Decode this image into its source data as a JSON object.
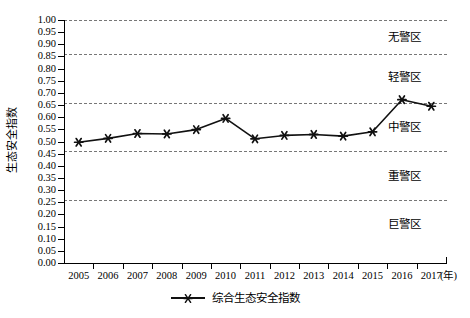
{
  "chart_data": {
    "type": "line",
    "title": "",
    "xlabel": "(年)",
    "ylabel": "生态安全指数",
    "categories": [
      "2005",
      "2006",
      "2007",
      "2008",
      "2009",
      "2010",
      "2011",
      "2012",
      "2013",
      "2014",
      "2015",
      "2016",
      "2017"
    ],
    "series": [
      {
        "name": "综合生态安全指数",
        "values": [
          0.497,
          0.513,
          0.533,
          0.531,
          0.549,
          0.595,
          0.511,
          0.525,
          0.529,
          0.522,
          0.54,
          0.672,
          0.645
        ],
        "marker": "asterisk-star",
        "color": "#111111"
      }
    ],
    "ylim": [
      0.0,
      1.0
    ],
    "ytick_labels": [
      "1.00",
      "0.95",
      "0.90",
      "0.85",
      "0.80",
      "0.75",
      "0.70",
      "0.65",
      "0.60",
      "0.55",
      "0.50",
      "0.45",
      "0.40",
      "0.35",
      "0.30",
      "0.25",
      "0.20",
      "0.15",
      "0.10",
      "0.05",
      "0.00"
    ],
    "ytick_values": [
      1.0,
      0.95,
      0.9,
      0.85,
      0.8,
      0.75,
      0.7,
      0.65,
      0.6,
      0.55,
      0.5,
      0.45,
      0.4,
      0.35,
      0.3,
      0.25,
      0.2,
      0.15,
      0.1,
      0.05,
      0.0
    ],
    "grid": true,
    "gridline_style": "dashed",
    "threshold_lines": [
      1.0,
      0.86,
      0.66,
      0.46,
      0.26
    ],
    "zones": [
      {
        "label": "无警区",
        "center": 0.93
      },
      {
        "label": "轻警区",
        "center": 0.765
      },
      {
        "label": "中警区",
        "center": 0.56
      },
      {
        "label": "重警区",
        "center": 0.36
      },
      {
        "label": "巨警区",
        "center": 0.16
      }
    ],
    "legend": {
      "position": "bottom-center",
      "entries": [
        "综合生态安全指数"
      ]
    }
  },
  "legend_label": "综合生态安全指数",
  "axis": {
    "y_title": "生态安全指数",
    "x_unit": "(年)"
  }
}
